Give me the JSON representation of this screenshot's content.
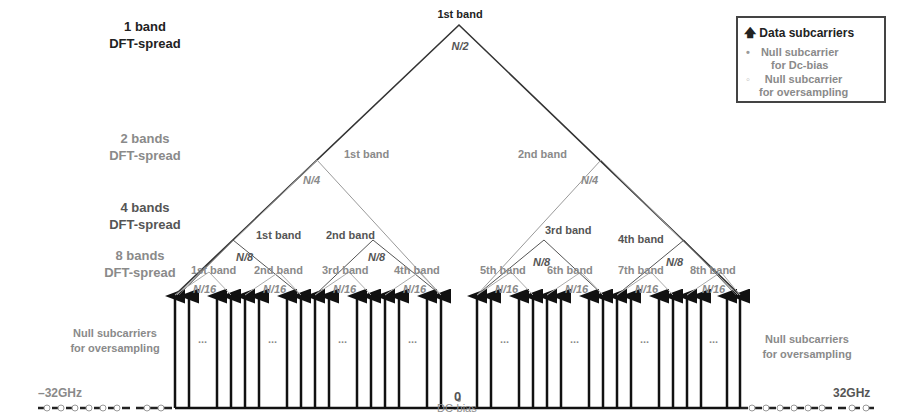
{
  "title_labels": {
    "one_band": [
      "1 band",
      "DFT-spread"
    ],
    "two_bands": [
      "2 bands",
      "DFT-spread"
    ],
    "four_bands": [
      "4 bands",
      "DFT-spread"
    ],
    "eight_bands": [
      "8 bands",
      "DFT-spread"
    ]
  },
  "legend": {
    "data": "Data subcarriers",
    "null_dc": [
      "Null subcarrier",
      "for Dc-bias"
    ],
    "null_os": [
      "Null subcarrier",
      "for oversampling"
    ]
  },
  "level1": {
    "band": "1st band",
    "size": "N/2"
  },
  "level2": [
    {
      "band": "1st band",
      "size": "N/4"
    },
    {
      "band": "2nd band",
      "size": "N/4"
    }
  ],
  "level4": [
    {
      "band": "1st band"
    },
    {
      "band": "2nd band"
    },
    {
      "band": "3rd band"
    },
    {
      "band": "4th band"
    }
  ],
  "level4_size": "N/8",
  "level8": [
    {
      "band": "1st band"
    },
    {
      "band": "2nd band"
    },
    {
      "band": "3rd band"
    },
    {
      "band": "4th band"
    },
    {
      "band": "5th band"
    },
    {
      "band": "6th band"
    },
    {
      "band": "7th band"
    },
    {
      "band": "8th band"
    }
  ],
  "level8_size": "N/16",
  "side_labels": {
    "left": [
      "Null subcarriers",
      "for oversampling"
    ],
    "right": [
      "Null subcarriers",
      "for oversampling"
    ]
  },
  "axis": {
    "left": "–32GHz",
    "right": "32GHz",
    "center": "0",
    "dc": "DC-bias"
  },
  "ellipsis": "...",
  "colors": {
    "dark": "#222222",
    "gray": "#8a8a8a",
    "mid": "#555555"
  }
}
